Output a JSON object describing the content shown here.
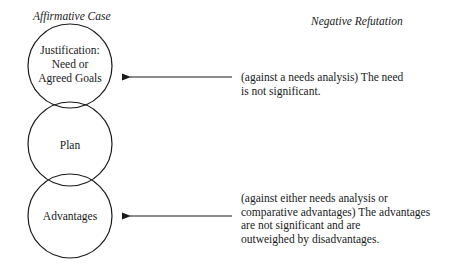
{
  "headings": {
    "affirmative": "Affirmative Case",
    "negative": "Negative Refutation"
  },
  "circles": [
    {
      "id": "justification",
      "lines": [
        "Justification:",
        "Need or",
        "Agreed Goals"
      ]
    },
    {
      "id": "plan",
      "lines": [
        "Plan"
      ]
    },
    {
      "id": "advantages",
      "lines": [
        "Advantages"
      ]
    }
  ],
  "refutations": [
    {
      "target": "justification",
      "lines": [
        "(against a needs analysis) The need",
        "is not significant."
      ]
    },
    {
      "target": "advantages",
      "lines": [
        "(against either needs analysis or",
        "comparative advantages) The advantages",
        "are not significant and are",
        "outweighed by disadvantages."
      ]
    }
  ],
  "colors": {
    "stroke": "#1a1a1a",
    "background": "#ffffff"
  }
}
